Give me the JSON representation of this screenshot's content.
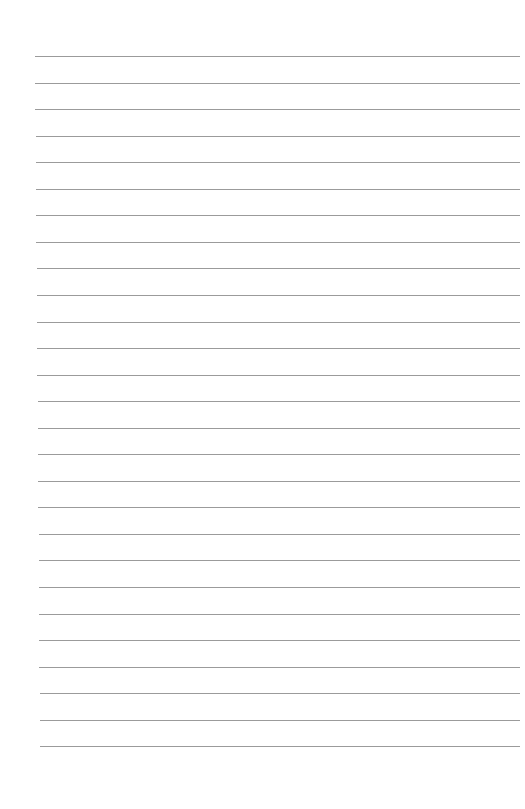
{
  "page": {
    "type": "lined-paper",
    "background_color": "#ffffff",
    "line_color": "#8a8a8a",
    "line_count": 27,
    "first_line_y": 56,
    "line_spacing": 26.55,
    "line_left_start": 35,
    "line_left_end": 40,
    "line_right": 520
  }
}
